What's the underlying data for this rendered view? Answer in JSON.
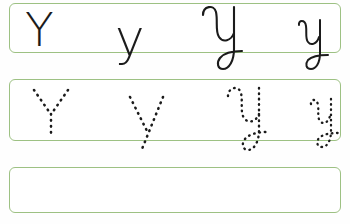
{
  "worksheet": {
    "title": "Letter Y handwriting practice worksheet",
    "letter": "Y",
    "background_color": "#fefefe",
    "rule_color": "#9dc183",
    "ink_color": "#1b1b1b",
    "separator": "-",
    "rows": [
      {
        "id": "row-model",
        "style": "solid",
        "description": "Model row: solid printed and cursive letterforms to copy",
        "items": [
          {
            "glyph": "Y",
            "script": "print",
            "case": "uppercase"
          },
          {
            "glyph": "-",
            "script": "dash",
            "case": "separator"
          },
          {
            "glyph": "y",
            "script": "print",
            "case": "lowercase"
          },
          {
            "glyph": "-",
            "script": "dash",
            "case": "separator"
          },
          {
            "glyph": "Y",
            "script": "cursive",
            "case": "uppercase"
          },
          {
            "glyph": "-",
            "script": "dash",
            "case": "separator"
          },
          {
            "glyph": "y",
            "script": "cursive",
            "case": "lowercase"
          }
        ]
      },
      {
        "id": "row-trace",
        "style": "dotted",
        "description": "Tracing row: same letters rendered as dotted guides",
        "items": [
          {
            "glyph": "Y",
            "script": "print",
            "case": "uppercase"
          },
          {
            "glyph": "-",
            "script": "dash",
            "case": "separator"
          },
          {
            "glyph": "y",
            "script": "print",
            "case": "lowercase"
          },
          {
            "glyph": "-",
            "script": "dash",
            "case": "separator"
          },
          {
            "glyph": "Y",
            "script": "cursive",
            "case": "uppercase"
          },
          {
            "glyph": "-",
            "script": "dash",
            "case": "separator"
          },
          {
            "glyph": "y",
            "script": "cursive",
            "case": "lowercase"
          }
        ]
      },
      {
        "id": "row-blank",
        "style": "blank",
        "description": "Empty practice row for free writing",
        "items": []
      }
    ]
  }
}
